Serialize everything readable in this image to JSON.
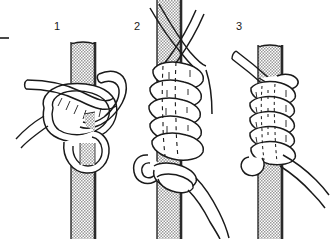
{
  "figure": {
    "kind": "knot-tying-instruction-diagram",
    "caption_marks": {
      "left_dash": "-"
    },
    "background_color": "#ffffff",
    "line_color": "#1a1a1a",
    "rope_fill": "#ffffff",
    "pole_fill": "#d8d8d8",
    "pole_stipple_color": "#8a8a8a",
    "steps": [
      {
        "number": "1",
        "label_x": 57,
        "label_y": 30,
        "description": "Rope crossed over pole forming initial loop and bight"
      },
      {
        "number": "2",
        "label_x": 137,
        "label_y": 30,
        "description": "Rope coiled in successive turns down the pole"
      },
      {
        "number": "3",
        "label_x": 239,
        "label_y": 30,
        "description": "Coils drawn tight, knot completed with ends pulled out"
      }
    ]
  }
}
